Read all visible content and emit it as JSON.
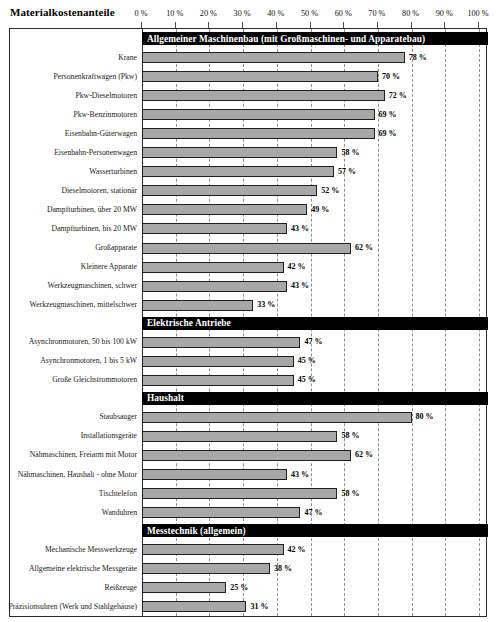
{
  "header": {
    "title": "Materialkostenanteile"
  },
  "axis": {
    "unit": "%",
    "min": 0,
    "max": 100,
    "step": 10,
    "tick_labels": [
      "0 %",
      "10 %",
      "20 %",
      "30 %",
      "40 %",
      "50 %",
      "60 %",
      "70 %",
      "80 %",
      "90 %",
      "100 %"
    ]
  },
  "colors": {
    "bar_fill": "#a8a8a8",
    "bar_stroke": "#1f1f1f",
    "section_header_bg": "#000000",
    "section_header_text": "#ffffff",
    "grid": "#8d8d8d",
    "frame": "#2b2b2b"
  },
  "chart_data": {
    "type": "bar",
    "orientation": "horizontal",
    "title": "Materialkostenanteile",
    "xlabel": "",
    "ylabel": "",
    "xlim": [
      0,
      100
    ],
    "xticks": [
      0,
      10,
      20,
      30,
      40,
      50,
      60,
      70,
      80,
      90,
      100
    ],
    "xtick_labels": [
      "0 %",
      "10 %",
      "20 %",
      "30 %",
      "40 %",
      "50 %",
      "60 %",
      "70 %",
      "80 %",
      "90 %",
      "100 %"
    ],
    "grid": true,
    "legend": false,
    "value_suffix": " %",
    "groups": [
      {
        "name": "Allgemeiner Maschinenbau (mit Großmaschinen- und Apparatebau)",
        "categories": [
          "Krane",
          "Personenkraftwagen (Pkw)",
          "Pkw-Dieselmotoren",
          "Pkw-Benzinmotoren",
          "Eisenbahn-Güterwagen",
          "Eisenbahn-Personenwagen",
          "Wasserturbinen",
          "Dieselmotoren, stationär",
          "Dampfturbinen, über 20 MW",
          "Dampfturbinen, bis 20 MW",
          "Großapparate",
          "Kleinere Apparate",
          "Werkzeugmaschinen, schwer",
          "Werkzeugmaschinen, mittelschwer"
        ],
        "values": [
          78,
          70,
          72,
          69,
          69,
          58,
          57,
          52,
          49,
          43,
          62,
          42,
          43,
          33
        ],
        "value_labels": [
          "78 %",
          "70 %",
          "72 %",
          "69 %",
          "69 %",
          "58 %",
          "57 %",
          "52 %",
          "49 %",
          "43 %",
          "62 %",
          "42 %",
          "43 %",
          "33 %"
        ]
      },
      {
        "name": "Elektrische Antriebe",
        "categories": [
          "Asynchronmotoren, 50 bis 100 kW",
          "Asynchronmotoren, 1 bis 5 kW",
          "Große Gleichstrommotoren"
        ],
        "values": [
          47,
          45,
          45
        ],
        "value_labels": [
          "47 %",
          "45 %",
          "45 %"
        ]
      },
      {
        "name": "Haushalt",
        "categories": [
          "Staubsauger",
          "Installationsgeräte",
          "Nähmaschinen, Freiarm mit Motor",
          "Nähmaschinen, Haushalt - ohne Motor",
          "Tischtelefon",
          "Wanduhren"
        ],
        "values": [
          80,
          58,
          62,
          43,
          58,
          47
        ],
        "value_labels": [
          "80 %",
          "58 %",
          "62 %",
          "43 %",
          "58 %",
          "47 %"
        ]
      },
      {
        "name": "Messtechnik (allgemein)",
        "categories": [
          "Mechanische Messwerkzeuge",
          "Allgemeine elektrische Messgeräte",
          "Reißzeuge",
          "Präzisionsuhren (Werk und Stahlgehäuse)"
        ],
        "values": [
          42,
          38,
          25,
          31
        ],
        "value_labels": [
          "42 %",
          "38 %",
          "25 %",
          "31 %"
        ]
      }
    ]
  }
}
